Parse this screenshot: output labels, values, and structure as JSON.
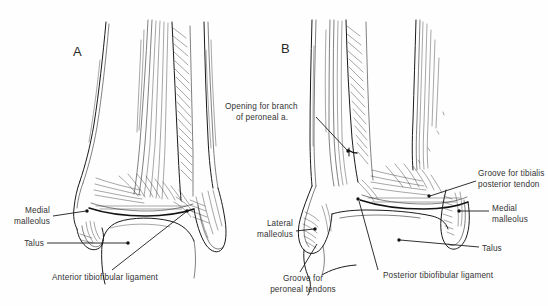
{
  "figure": {
    "background_color": "#fefefe",
    "ink_color": "#1a1a1a",
    "text_color": "#333333",
    "panels": [
      {
        "id": "A",
        "letter": "A",
        "view": "anterior"
      },
      {
        "id": "B",
        "letter": "B",
        "view": "posterior"
      }
    ]
  },
  "panel_a": {
    "letter": "A",
    "labels": {
      "medial_malleolus_line1": "Medial",
      "medial_malleolus_line2": "malleolus",
      "talus": "Talus",
      "anterior_tibiofibular_ligament": "Anterior tibiofibular ligament"
    }
  },
  "panel_b": {
    "letter": "B",
    "labels": {
      "opening_line1": "Opening for branch",
      "opening_line2": "of peroneal a.",
      "lateral_malleolus_line1": "Lateral",
      "lateral_malleolus_line2": "malleolus",
      "groove_peroneal_line1": "Groove for",
      "groove_peroneal_line2": "peroneal tendons",
      "posterior_tibiofibular_ligament": "Posterior tibiofibular ligament",
      "groove_tibialis_line1": "Groove for tibialis",
      "groove_tibialis_line2": "posterior tendon",
      "medial_malleolus_line1": "Medial",
      "medial_malleolus_line2": "malleolus",
      "talus": "Talus"
    }
  }
}
